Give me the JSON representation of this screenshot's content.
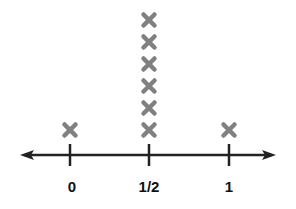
{
  "chart_data": {
    "type": "scatter",
    "subtype": "line-plot (dot plot with X marks)",
    "title": "",
    "xlabel": "",
    "ylabel": "",
    "categories": [
      "0",
      "1/2",
      "1"
    ],
    "x": [
      0,
      0.5,
      1
    ],
    "values": [
      1,
      6,
      1
    ],
    "marker": "x",
    "xlim": [
      -0.3,
      1.3
    ],
    "grid": false,
    "legend": null,
    "axis_arrows": "both ends"
  },
  "style": {
    "marker_color": "#808080",
    "axis_color": "#222222",
    "label_color": "#111111"
  },
  "layout": {
    "axis_y": 155,
    "axis_x_start": 20,
    "axis_x_end": 276,
    "tick_px": [
      70,
      149,
      229
    ],
    "first_marker_y": 130,
    "marker_spacing": 22,
    "label_y": 192
  }
}
